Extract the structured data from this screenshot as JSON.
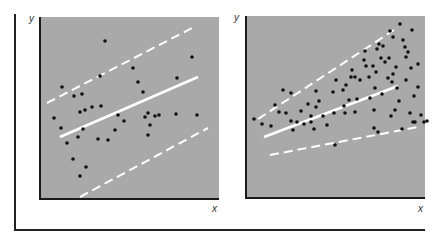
{
  "caption_cut": "(text cut off at top edge)",
  "chart_data": [
    {
      "type": "scatter",
      "title": "",
      "subtitle": "Homoscedastic scatter: constant spread around regression line",
      "xlabel": "x",
      "ylabel": "y",
      "tick_labels": [],
      "grid": false,
      "legend": null,
      "plot_box_px": {
        "x": 39,
        "y": 17,
        "w": 180,
        "h": 183
      },
      "points_px": [
        [
          62,
          87
        ],
        [
          74,
          96
        ],
        [
          82,
          94
        ],
        [
          54,
          118
        ],
        [
          92,
          107
        ],
        [
          101,
          106
        ],
        [
          118,
          115
        ],
        [
          155,
          116
        ],
        [
          159,
          115
        ],
        [
          176,
          114
        ],
        [
          197,
          115
        ],
        [
          138,
          82
        ],
        [
          143,
          92
        ],
        [
          177,
          78
        ],
        [
          192,
          57
        ],
        [
          133,
          68
        ],
        [
          105,
          41
        ],
        [
          100,
          76
        ],
        [
          85,
          110
        ],
        [
          80,
          112
        ],
        [
          83,
          129
        ],
        [
          98,
          139
        ],
        [
          108,
          140
        ],
        [
          115,
          130
        ],
        [
          61,
          128
        ],
        [
          67,
          143
        ],
        [
          73,
          159
        ],
        [
          80,
          176
        ],
        [
          78,
          137
        ],
        [
          86,
          167
        ],
        [
          124,
          121
        ],
        [
          148,
          113
        ],
        [
          148,
          135
        ],
        [
          145,
          117
        ],
        [
          150,
          125
        ]
      ],
      "regression_line_px": [
        [
          60,
          137
        ],
        [
          198,
          77
        ]
      ],
      "upper_band_px": [
        [
          47,
          103
        ],
        [
          196,
          26
        ]
      ],
      "lower_band_px": [
        [
          80,
          197
        ],
        [
          208,
          128
        ]
      ]
    },
    {
      "type": "scatter",
      "title": "",
      "subtitle": "Heteroscedastic scatter: spread widens as x increases",
      "xlabel": "x",
      "ylabel": "y",
      "tick_labels": [],
      "grid": false,
      "legend": null,
      "plot_box_px": {
        "x": 245,
        "y": 16,
        "w": 180,
        "h": 183
      },
      "points_px": [
        [
          254,
          119
        ],
        [
          262,
          124
        ],
        [
          271,
          126
        ],
        [
          279,
          112
        ],
        [
          283,
          90
        ],
        [
          291,
          93
        ],
        [
          275,
          105
        ],
        [
          286,
          113
        ],
        [
          301,
          111
        ],
        [
          308,
          104
        ],
        [
          311,
          116
        ],
        [
          311,
          122
        ],
        [
          316,
          91
        ],
        [
          316,
          107
        ],
        [
          319,
          101
        ],
        [
          323,
          116
        ],
        [
          291,
          121
        ],
        [
          293,
          130
        ],
        [
          297,
          122
        ],
        [
          304,
          124
        ],
        [
          314,
          129
        ],
        [
          327,
          125
        ],
        [
          333,
          92
        ],
        [
          334,
          113
        ],
        [
          336,
          80
        ],
        [
          343,
          90
        ],
        [
          345,
          113
        ],
        [
          346,
          85
        ],
        [
          351,
          77
        ],
        [
          349,
          100
        ],
        [
          352,
          70
        ],
        [
          355,
          112
        ],
        [
          357,
          99
        ],
        [
          360,
          80
        ],
        [
          364,
          60
        ],
        [
          369,
          77
        ],
        [
          370,
          98
        ],
        [
          373,
          66
        ],
        [
          374,
          110
        ],
        [
          375,
          88
        ],
        [
          377,
          49
        ],
        [
          376,
          72
        ],
        [
          381,
          58
        ],
        [
          382,
          94
        ],
        [
          385,
          62
        ],
        [
          389,
          58
        ],
        [
          391,
          116
        ],
        [
          388,
          78
        ],
        [
          392,
          82
        ],
        [
          393,
          74
        ],
        [
          395,
          110
        ],
        [
          397,
          88
        ],
        [
          400,
          24
        ],
        [
          403,
          40
        ],
        [
          405,
          47
        ],
        [
          406,
          80
        ],
        [
          410,
          113
        ],
        [
          411,
          68
        ],
        [
          413,
          122
        ],
        [
          414,
          96
        ],
        [
          415,
          122
        ],
        [
          418,
          87
        ],
        [
          421,
          115
        ],
        [
          424,
          122
        ],
        [
          408,
          52
        ],
        [
          406,
          57
        ],
        [
          412,
          30
        ],
        [
          418,
          64
        ],
        [
          396,
          67
        ],
        [
          399,
          101
        ],
        [
          379,
          44
        ],
        [
          383,
          46
        ],
        [
          390,
          31
        ],
        [
          393,
          37
        ],
        [
          366,
          66
        ],
        [
          355,
          77
        ],
        [
          365,
          51
        ],
        [
          344,
          106
        ],
        [
          335,
          145
        ],
        [
          374,
          128
        ],
        [
          402,
          129
        ],
        [
          427,
          121
        ],
        [
          378,
          132
        ]
      ],
      "regression_line_px": [
        [
          264,
          137
        ],
        [
          398,
          86
        ]
      ],
      "upper_band_px": [
        [
          258,
          119
        ],
        [
          394,
          30
        ]
      ],
      "lower_band_px": [
        [
          270,
          155
        ],
        [
          418,
          127
        ]
      ]
    }
  ],
  "labels": {
    "left_y": "y",
    "left_x": "x",
    "right_y": "y",
    "right_x": "x"
  },
  "colors": {
    "panel_bg": "#a9a9a9",
    "dot": "#111111",
    "line": "#ffffff",
    "axis": "#1a1a1a"
  }
}
